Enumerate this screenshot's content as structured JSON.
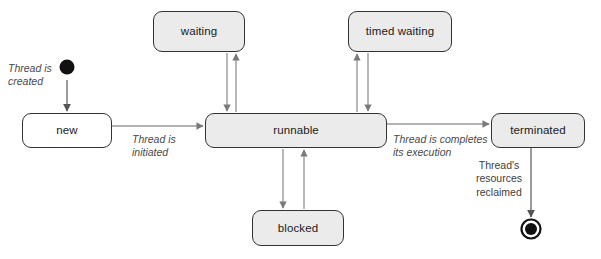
{
  "diagram": {
    "type": "uml-state-machine",
    "colors": {
      "node_fill": "#ebebeb",
      "node_fill_plain": "#ffffff",
      "node_border": "#333333",
      "edge": "#7a7a7a",
      "label_text": "#4a4a4a",
      "initial_state": "#111111",
      "background": "#ffffff"
    },
    "nodes": [
      {
        "id": "initial",
        "kind": "initial-state",
        "label": "",
        "x": 65,
        "y": 66,
        "w": 15,
        "h": 15
      },
      {
        "id": "new",
        "kind": "state",
        "label": "new",
        "x": 22,
        "y": 113,
        "w": 90,
        "h": 35,
        "fill": "plain"
      },
      {
        "id": "waiting",
        "kind": "state",
        "label": "waiting",
        "x": 153,
        "y": 11,
        "w": 92,
        "h": 41
      },
      {
        "id": "runnable",
        "kind": "state",
        "label": "runnable",
        "x": 205,
        "y": 113,
        "w": 182,
        "h": 35
      },
      {
        "id": "timed-waiting",
        "kind": "state",
        "label": "timed waiting",
        "x": 348,
        "y": 11,
        "w": 104,
        "h": 41
      },
      {
        "id": "blocked",
        "kind": "state",
        "label": "blocked",
        "x": 252,
        "y": 210,
        "w": 92,
        "h": 36
      },
      {
        "id": "terminated",
        "kind": "state",
        "label": "terminated",
        "x": 491,
        "y": 113,
        "w": 94,
        "h": 35
      },
      {
        "id": "final",
        "kind": "final-state",
        "label": "",
        "x": 521,
        "y": 219,
        "w": 20,
        "h": 20
      }
    ],
    "edges": [
      {
        "id": "initial-to-new",
        "from": "initial",
        "to": "new",
        "label": "Thread is\ncreated",
        "label_style": "italic"
      },
      {
        "id": "new-to-runnable",
        "from": "new",
        "to": "runnable",
        "label": "Thread is\ninitiated",
        "label_style": "italic"
      },
      {
        "id": "runnable-to-waiting",
        "from": "runnable",
        "to": "waiting",
        "label": "",
        "label_style": "none"
      },
      {
        "id": "waiting-to-runnable",
        "from": "waiting",
        "to": "runnable",
        "label": "",
        "label_style": "none"
      },
      {
        "id": "runnable-to-timed",
        "from": "runnable",
        "to": "timed-waiting",
        "label": "",
        "label_style": "none"
      },
      {
        "id": "timed-to-runnable",
        "from": "timed-waiting",
        "to": "runnable",
        "label": "",
        "label_style": "none"
      },
      {
        "id": "runnable-to-blocked",
        "from": "runnable",
        "to": "blocked",
        "label": "",
        "label_style": "none"
      },
      {
        "id": "blocked-to-runnable",
        "from": "blocked",
        "to": "runnable",
        "label": "",
        "label_style": "none"
      },
      {
        "id": "runnable-to-terminated",
        "from": "runnable",
        "to": "terminated",
        "label": "Thread is completes\nits execution",
        "label_style": "italic"
      },
      {
        "id": "terminated-to-final",
        "from": "terminated",
        "to": "final",
        "label": "Thread's\nresources\nreclaimed",
        "label_style": "upright"
      }
    ],
    "labels": {
      "thread_is_created": "Thread is\ncreated",
      "thread_is_initiated": "Thread is\ninitiated",
      "thread_completes_execution": "Thread is completes\nits execution",
      "threads_resources_reclaimed": "Thread's\nresources\nreclaimed"
    }
  }
}
